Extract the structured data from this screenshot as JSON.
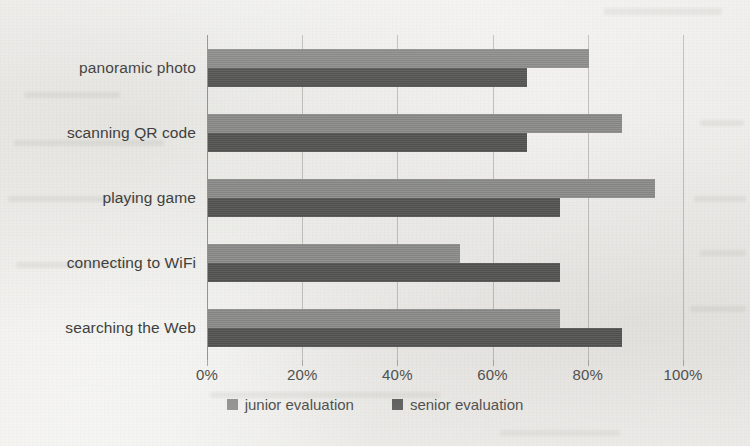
{
  "chart_data": {
    "type": "bar",
    "orientation": "horizontal",
    "title": "",
    "xlabel": "",
    "ylabel": "",
    "xlim": [
      0,
      100
    ],
    "x_tick_labels": [
      "0%",
      "20%",
      "40%",
      "60%",
      "80%",
      "100%"
    ],
    "x_ticks": [
      0,
      20,
      40,
      60,
      80,
      100
    ],
    "grid": true,
    "legend_position": "bottom",
    "categories": [
      "panoramic photo",
      "scanning QR code",
      "playing game",
      "connecting to WiFi",
      "searching the Web"
    ],
    "series": [
      {
        "name": "junior evaluation",
        "color": "#8b8b89",
        "values": [
          80,
          87,
          94,
          53,
          74
        ]
      },
      {
        "name": "senior evaluation",
        "color": "#545452",
        "values": [
          67,
          67,
          74,
          74,
          87
        ]
      }
    ]
  },
  "legend": {
    "items": [
      {
        "label": "junior evaluation",
        "swatch_class": "swatch-junior"
      },
      {
        "label": "senior evaluation",
        "swatch_class": "swatch-senior"
      }
    ]
  }
}
